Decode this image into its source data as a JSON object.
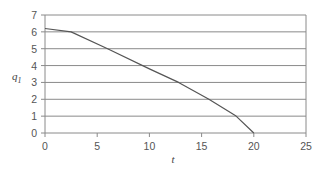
{
  "chart_data": {
    "type": "line",
    "title": "",
    "xlabel": "t",
    "ylabel": "q",
    "ylabel_subscript": "1",
    "xlim": [
      0,
      25
    ],
    "ylim": [
      0,
      7
    ],
    "x_ticks": [
      0,
      5,
      10,
      15,
      20,
      25
    ],
    "y_ticks": [
      0,
      1,
      2,
      3,
      4,
      5,
      6,
      7
    ],
    "grid": "horizontal",
    "legend": null,
    "series": [
      {
        "name": "q1",
        "x": [
          0,
          2.5,
          6,
          10,
          12.8,
          15.7,
          18.3,
          20
        ],
        "y": [
          6.2,
          6.0,
          5.0,
          3.8,
          3.0,
          2.0,
          1.0,
          0.0
        ]
      }
    ],
    "colors": {
      "line": "#555555",
      "grid": "#8a8a8a",
      "frame": "#8a8a8a"
    }
  }
}
